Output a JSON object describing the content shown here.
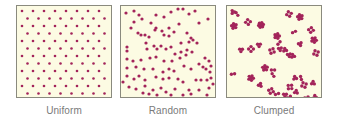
{
  "figure": {
    "panels": [
      {
        "id": "uniform",
        "label": "Uniform",
        "left": 16
      },
      {
        "id": "random",
        "label": "Random",
        "left": 120
      },
      {
        "id": "clumped",
        "label": "Clumped",
        "left": 226
      }
    ],
    "colors": {
      "background": "#fcfbe3",
      "dot": "#a3245a",
      "border": "#8a8a7e",
      "label": "#7a7a7a"
    },
    "random_dots": [
      [
        5,
        7
      ],
      [
        13,
        5
      ],
      [
        18,
        9
      ],
      [
        21,
        13
      ],
      [
        13,
        16
      ],
      [
        10,
        22
      ],
      [
        35,
        9
      ],
      [
        43,
        11
      ],
      [
        50,
        6
      ],
      [
        57,
        3
      ],
      [
        62,
        3
      ],
      [
        68,
        8
      ],
      [
        74,
        5
      ],
      [
        87,
        13
      ],
      [
        78,
        17
      ],
      [
        58,
        18
      ],
      [
        48,
        22
      ],
      [
        30,
        17
      ],
      [
        35,
        22
      ],
      [
        17,
        27
      ],
      [
        20,
        29
      ],
      [
        24,
        29
      ],
      [
        28,
        31
      ],
      [
        34,
        24
      ],
      [
        41,
        25
      ],
      [
        43,
        29
      ],
      [
        48,
        30
      ],
      [
        53,
        26
      ],
      [
        66,
        27
      ],
      [
        70,
        32
      ],
      [
        72,
        34
      ],
      [
        76,
        37
      ],
      [
        68,
        36
      ],
      [
        60,
        37
      ],
      [
        6,
        41
      ],
      [
        6,
        45
      ],
      [
        25,
        37
      ],
      [
        26,
        43
      ],
      [
        33,
        40
      ],
      [
        36,
        43
      ],
      [
        40,
        40
      ],
      [
        45,
        43
      ],
      [
        50,
        41
      ],
      [
        54,
        48
      ],
      [
        60,
        46
      ],
      [
        66,
        44
      ],
      [
        71,
        46
      ],
      [
        6,
        53
      ],
      [
        12,
        55
      ],
      [
        20,
        54
      ],
      [
        29,
        52
      ],
      [
        35,
        51
      ],
      [
        43,
        55
      ],
      [
        51,
        55
      ],
      [
        59,
        52
      ],
      [
        65,
        49
      ],
      [
        84,
        52
      ],
      [
        88,
        55
      ],
      [
        82,
        61
      ],
      [
        85,
        63
      ],
      [
        90,
        60
      ],
      [
        89,
        66
      ],
      [
        6,
        62
      ],
      [
        15,
        61
      ],
      [
        23,
        63
      ],
      [
        32,
        63
      ],
      [
        42,
        66
      ],
      [
        48,
        63
      ],
      [
        53,
        65
      ],
      [
        63,
        60
      ],
      [
        70,
        63
      ],
      [
        78,
        58
      ],
      [
        6,
        70
      ],
      [
        13,
        73
      ],
      [
        18,
        70
      ],
      [
        24,
        74
      ],
      [
        35,
        71
      ],
      [
        42,
        73
      ],
      [
        48,
        72
      ],
      [
        57,
        73
      ],
      [
        62,
        76
      ],
      [
        75,
        74
      ],
      [
        80,
        74
      ],
      [
        86,
        74
      ],
      [
        90,
        72
      ],
      [
        92,
        78
      ],
      [
        8,
        81
      ],
      [
        15,
        83
      ],
      [
        24,
        80
      ],
      [
        32,
        84
      ],
      [
        40,
        82
      ],
      [
        45,
        86
      ],
      [
        54,
        83
      ],
      [
        68,
        84
      ],
      [
        78,
        84
      ],
      [
        88,
        82
      ],
      [
        22,
        87
      ],
      [
        28,
        88
      ],
      [
        36,
        89
      ],
      [
        50,
        89
      ],
      [
        62,
        89
      ],
      [
        70,
        88
      ],
      [
        86,
        89
      ],
      [
        2,
        76
      ]
    ],
    "clumped_groups": [
      [
        6,
        6,
        3
      ],
      [
        10,
        8,
        2
      ],
      [
        7,
        20,
        5
      ],
      [
        21,
        16,
        4
      ],
      [
        34,
        19,
        6
      ],
      [
        50,
        30,
        5
      ],
      [
        62,
        8,
        4
      ],
      [
        73,
        11,
        5
      ],
      [
        84,
        24,
        4
      ],
      [
        67,
        26,
        2
      ],
      [
        14,
        44,
        3
      ],
      [
        24,
        43,
        4
      ],
      [
        32,
        39,
        3
      ],
      [
        45,
        45,
        4
      ],
      [
        53,
        43,
        3
      ],
      [
        58,
        44,
        3
      ],
      [
        62,
        49,
        3
      ],
      [
        66,
        50,
        3
      ],
      [
        73,
        38,
        3
      ],
      [
        87,
        34,
        5
      ],
      [
        89,
        47,
        4
      ],
      [
        38,
        62,
        5
      ],
      [
        46,
        64,
        2
      ],
      [
        46,
        69,
        2
      ],
      [
        24,
        72,
        5
      ],
      [
        6,
        68,
        2
      ],
      [
        33,
        79,
        3
      ],
      [
        44,
        85,
        4
      ],
      [
        50,
        88,
        2
      ],
      [
        63,
        81,
        4
      ],
      [
        69,
        86,
        3
      ],
      [
        77,
        79,
        4
      ],
      [
        86,
        77,
        3
      ],
      [
        58,
        89,
        3
      ],
      [
        62,
        91,
        2
      ],
      [
        80,
        93,
        4
      ],
      [
        88,
        91,
        3
      ],
      [
        19,
        96,
        3
      ],
      [
        68,
        72,
        3
      ],
      [
        74,
        72,
        2
      ],
      [
        52,
        37,
        2
      ]
    ]
  }
}
